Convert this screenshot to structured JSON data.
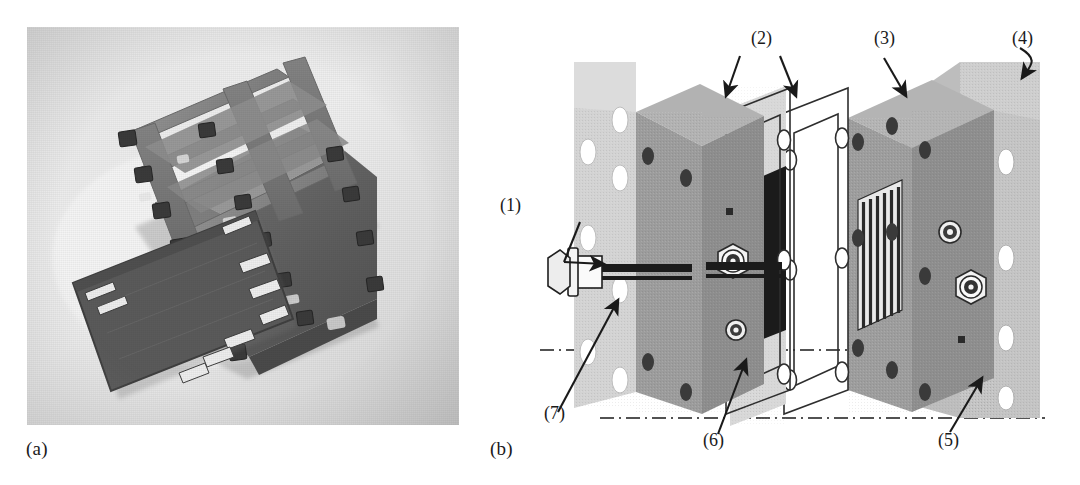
{
  "figure": {
    "panels": [
      {
        "id": "a",
        "label": "(a)",
        "type": "photograph",
        "description": "Assembled fuel cell stack with tie rods and nuts, with a separate dark end/bipolar plate in the foreground"
      },
      {
        "id": "b",
        "label": "(b)",
        "type": "exploded-diagram",
        "description": "Exploded isometric view of a single PEM fuel cell assembly"
      }
    ]
  },
  "panel_a": {
    "label": "(a)"
  },
  "panel_b": {
    "label": "(b)",
    "callouts": [
      {
        "key": "1",
        "label": "(1)",
        "arrow": "bent-right",
        "target": "tie rod / bolt assembly"
      },
      {
        "key": "2",
        "label": "(2)",
        "arrow": "down-split",
        "target": "gasket frames"
      },
      {
        "key": "3",
        "label": "(3)",
        "arrow": "down",
        "target": "bipolar plate with flow field channels"
      },
      {
        "key": "4",
        "label": "(4)",
        "arrow": "hook-down",
        "target": "right end plate"
      },
      {
        "key": "5",
        "label": "(5)",
        "arrow": "up-left",
        "target": "graphite plate"
      },
      {
        "key": "6",
        "label": "(6)",
        "arrow": "up-left",
        "target": "current collector plate"
      },
      {
        "key": "7",
        "label": "(7)",
        "arrow": "up-right",
        "target": "threaded rod / insulating sleeve"
      }
    ],
    "components": [
      {
        "name": "left-end-plate",
        "fill": "#d4d4d4",
        "holes": 7
      },
      {
        "name": "left-graphite-plate",
        "fill": "#8d8d8d"
      },
      {
        "name": "left-bipolar-plate",
        "fill": "#a0a0a0"
      },
      {
        "name": "gasket-frame-1",
        "fill": "none",
        "stroke": "#333333"
      },
      {
        "name": "mea-membrane",
        "fill": "#1c1c1c"
      },
      {
        "name": "gasket-frame-2",
        "fill": "none",
        "stroke": "#333333"
      },
      {
        "name": "right-bipolar-plate",
        "fill": "#8f8f8f",
        "flow_channels": 7
      },
      {
        "name": "right-end-plate",
        "fill": "#bdbdbd",
        "holes": 4
      },
      {
        "name": "bolt-head",
        "fill": "#f2f2f2"
      },
      {
        "name": "threaded-rod",
        "fill": "#1c1c1c"
      }
    ],
    "centerlines": [
      {
        "name": "upper-centerline",
        "style": "dash-dot"
      },
      {
        "name": "lower-centerline",
        "style": "dash-dot"
      }
    ]
  },
  "colors": {
    "background": "#ffffff",
    "ink": "#1a1a1a",
    "light_gray": "#d4d4d4",
    "mid_gray": "#a0a0a0",
    "dark_gray": "#8d8d8d",
    "near_black": "#1c1c1c"
  }
}
